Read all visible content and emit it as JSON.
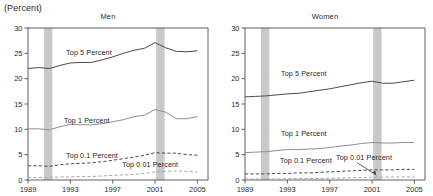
{
  "axis_unit_label": "(Percent)",
  "colors": {
    "line_dark": "#4a4a4a",
    "line_mid": "#8d8d8d",
    "line_light": "#a8a8a8",
    "recession_band": "#c9c9c9",
    "axis": "#3a3a3a",
    "text": "#2b2b2b"
  },
  "panels": [
    {
      "key": "men",
      "title": "Men"
    },
    {
      "key": "women",
      "title": "Women"
    }
  ],
  "chart_data": [
    {
      "type": "line",
      "title": "Men",
      "xlabel": "",
      "ylabel": "(Percent)",
      "xlim": [
        1989,
        2006
      ],
      "ylim": [
        0,
        30
      ],
      "xticks": [
        1989,
        1993,
        1997,
        2001,
        2005
      ],
      "yticks": [
        0,
        5,
        10,
        15,
        20,
        25,
        30
      ],
      "grid": false,
      "legend_position": "inline-annotations",
      "shaded_regions": [
        {
          "label": "recession",
          "x0": 1990.5,
          "x1": 1991.3
        },
        {
          "label": "recession",
          "x0": 2001.1,
          "x1": 2001.9
        }
      ],
      "x": [
        1989,
        1990,
        1991,
        1992,
        1993,
        1994,
        1995,
        1996,
        1997,
        1998,
        1999,
        2000,
        2001,
        2002,
        2003,
        2004,
        2005
      ],
      "series": [
        {
          "name": "Top 5 Percent",
          "style": "solid",
          "values": [
            22.0,
            22.2,
            22.0,
            22.6,
            23.1,
            23.2,
            23.2,
            23.7,
            24.3,
            25.0,
            25.6,
            26.0,
            27.1,
            26.1,
            25.4,
            25.3,
            25.5
          ]
        },
        {
          "name": "Top 1 Percent",
          "style": "solid",
          "values": [
            10.1,
            10.1,
            9.9,
            10.5,
            11.0,
            10.9,
            10.9,
            11.1,
            11.5,
            11.9,
            12.5,
            12.8,
            13.9,
            13.4,
            12.1,
            12.1,
            12.5
          ]
        },
        {
          "name": "Top 0.1 Percent",
          "style": "dashed",
          "values": [
            2.8,
            2.8,
            2.7,
            3.0,
            3.2,
            3.3,
            3.4,
            3.6,
            3.9,
            4.2,
            4.5,
            4.9,
            5.4,
            5.3,
            5.3,
            5.0,
            4.9
          ]
        },
        {
          "name": "Top 0.01 Percent",
          "style": "dashed",
          "values": [
            0.5,
            0.5,
            0.5,
            0.6,
            0.6,
            0.7,
            0.7,
            0.8,
            0.9,
            1.0,
            1.1,
            1.3,
            1.6,
            1.7,
            1.8,
            1.7,
            1.6
          ]
        }
      ]
    },
    {
      "type": "line",
      "title": "Women",
      "xlabel": "",
      "ylabel": "(Percent)",
      "xlim": [
        1989,
        2006
      ],
      "ylim": [
        0,
        30
      ],
      "xticks": [
        1989,
        1993,
        1997,
        2001,
        2005
      ],
      "yticks": [
        0,
        5,
        10,
        15,
        20,
        25,
        30
      ],
      "grid": false,
      "legend_position": "inline-annotations",
      "shaded_regions": [
        {
          "label": "recession",
          "x0": 1990.5,
          "x1": 1991.3
        },
        {
          "label": "recession",
          "x0": 2001.1,
          "x1": 2001.9
        }
      ],
      "x": [
        1989,
        1990,
        1991,
        1992,
        1993,
        1994,
        1995,
        1996,
        1997,
        1998,
        1999,
        2000,
        2001,
        2002,
        2003,
        2004,
        2005
      ],
      "series": [
        {
          "name": "Top 5 Percent",
          "style": "solid",
          "values": [
            16.4,
            16.5,
            16.6,
            16.8,
            17.0,
            17.1,
            17.4,
            17.7,
            18.0,
            18.4,
            18.8,
            19.2,
            19.5,
            19.1,
            19.1,
            19.4,
            19.7
          ]
        },
        {
          "name": "Top 1 Percent",
          "style": "solid",
          "values": [
            5.4,
            5.5,
            5.6,
            5.8,
            6.0,
            6.0,
            6.1,
            6.2,
            6.4,
            6.7,
            6.9,
            7.2,
            7.4,
            7.3,
            7.3,
            7.4,
            7.4
          ]
        },
        {
          "name": "Top 0.1 Percent",
          "style": "dashed",
          "values": [
            1.2,
            1.2,
            1.2,
            1.3,
            1.3,
            1.4,
            1.4,
            1.5,
            1.6,
            1.7,
            1.8,
            1.9,
            2.0,
            2.0,
            2.0,
            2.1,
            2.1
          ]
        },
        {
          "name": "Top 0.01 Percent",
          "style": "dashed",
          "values": [
            0.2,
            0.2,
            0.2,
            0.2,
            0.25,
            0.3,
            0.3,
            0.3,
            0.35,
            0.4,
            0.45,
            0.5,
            0.55,
            0.55,
            0.6,
            0.6,
            0.6
          ]
        }
      ]
    }
  ],
  "annotations": {
    "men": [
      {
        "text": "Top 5 Percent",
        "x": 1992.6,
        "y": 24.7,
        "anchor": "start"
      },
      {
        "text": "Top 1 Percent",
        "x": 1992.4,
        "y": 11.2,
        "anchor": "start"
      },
      {
        "text": "Top 0.1 Percent",
        "x": 1992.6,
        "y": 4.3,
        "anchor": "start"
      },
      {
        "text": "Top 0.01 Percent",
        "x": 1997.9,
        "y": 2.5,
        "anchor": "start"
      }
    ],
    "women": [
      {
        "text": "Top 5 Percent",
        "x": 1992.4,
        "y": 20.6,
        "anchor": "start"
      },
      {
        "text": "Top 1 Percent",
        "x": 1992.4,
        "y": 8.6,
        "anchor": "start"
      },
      {
        "text": "Top 0.1 Percent",
        "x": 1992.3,
        "y": 3.4,
        "anchor": "start"
      },
      {
        "text": "Top 0.01 Percent",
        "x": 1997.6,
        "y": 4.0,
        "anchor": "start"
      }
    ]
  },
  "leader_line": {
    "panel": "women",
    "from": {
      "x": 1999.6,
      "y": 3.4
    },
    "to": {
      "x": 2001.4,
      "y": 1.0
    }
  }
}
